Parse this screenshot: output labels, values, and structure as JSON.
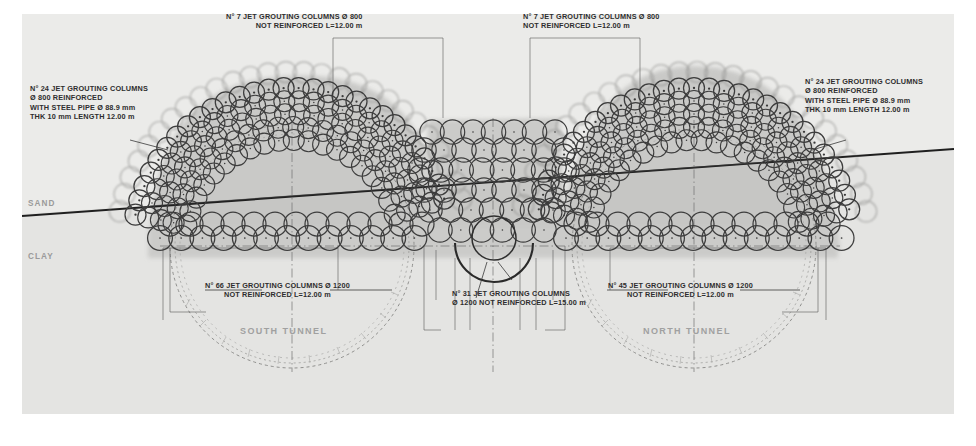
{
  "drawing": {
    "title": "Jet grouting treatment cross section - twin tunnels",
    "paper_color": "#ebebe9",
    "ink_color": "#2e2e2e",
    "halo_color": "#b9b9b7"
  },
  "callouts": [
    {
      "id": "left-reinforced",
      "lines": [
        "N° 24 JET GROUTING COLUMNS",
        "Ø 800 REINFORCED",
        "WITH STEEL PIPE Ø 88.9 mm",
        "THK 10 mm LENGTH 12.00 m"
      ],
      "align": "left"
    },
    {
      "id": "right-reinforced",
      "lines": [
        "N° 24 JET GROUTING COLUMNS",
        "Ø 800 REINFORCED",
        "WITH STEEL PIPE Ø 88.9 mm",
        "THK 10 mm LENGTH 12.00 m"
      ],
      "align": "left"
    },
    {
      "id": "top-left-crown",
      "lines": [
        "N° 7 JET GROUTING COLUMNS Ø 800",
        "NOT REINFORCED L=12.00 m"
      ],
      "align": "left"
    },
    {
      "id": "top-right-crown",
      "lines": [
        "N° 7 JET GROUTING COLUMNS Ø 800",
        "NOT REINFORCED L=12.00 m"
      ],
      "align": "left"
    },
    {
      "id": "south-bottom",
      "lines": [
        "N° 66 JET GROUTING COLUMNS Ø 1200",
        "NOT REINFORCED L=12.00 m"
      ],
      "align": "center"
    },
    {
      "id": "center-bottom",
      "lines": [
        "N° 31 JET GROUTING COLUMNS",
        "Ø 1200 NOT REINFORCED L=15.00 m"
      ],
      "align": "left"
    },
    {
      "id": "north-bottom",
      "lines": [
        "N° 45 JET GROUTING COLUMNS Ø 1200",
        "NOT REINFORCED L=12.00 m"
      ],
      "align": "center"
    }
  ],
  "strata": {
    "upper_label": "SAND",
    "lower_label": "CLAY"
  },
  "tunnels": {
    "south_label": "SOUTH TUNNEL",
    "north_label": "NORTH TUNNEL"
  }
}
